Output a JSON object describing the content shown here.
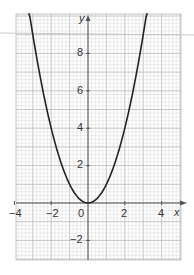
{
  "chart_data": {
    "type": "line",
    "title": "",
    "function": "y = x^2",
    "xlabel": "x",
    "ylabel": "y",
    "xlim": [
      -4,
      4.9
    ],
    "ylim": [
      -3.1,
      10.2
    ],
    "grid": true,
    "minor_grid_step": 0.2,
    "major_grid_step": 1,
    "x_ticks": [
      -4,
      -2,
      0,
      2,
      4
    ],
    "x_tick_labels": [
      "−4",
      "−2",
      "0",
      "2",
      "4"
    ],
    "y_ticks": [
      -2,
      2,
      4,
      6,
      8
    ],
    "y_tick_labels": [
      "−2",
      "2",
      "4",
      "6",
      "8"
    ],
    "series": [
      {
        "name": "parabola",
        "color": "#222222",
        "x": [
          -3.2,
          -3,
          -2.5,
          -2,
          -1.5,
          -1,
          -0.5,
          0,
          0.5,
          1,
          1.5,
          2,
          2.5,
          3,
          3.2
        ],
        "y": [
          10.24,
          9,
          6.25,
          4,
          2.25,
          1,
          0.25,
          0,
          0.25,
          1,
          2.25,
          4,
          6.25,
          9,
          10.24
        ]
      }
    ]
  },
  "labels": {
    "x_axis": "x",
    "y_axis": "y",
    "x_ticks": [
      "−4",
      "−2",
      "0",
      "2",
      "4"
    ],
    "y_ticks": [
      "8",
      "6",
      "4",
      "2",
      "−2"
    ]
  },
  "colors": {
    "grid_minor": "#d8d8d8",
    "grid_major": "#b8b8b8",
    "axis": "#555555",
    "curve": "#222222",
    "overlay_line": "#c8c8c8"
  }
}
